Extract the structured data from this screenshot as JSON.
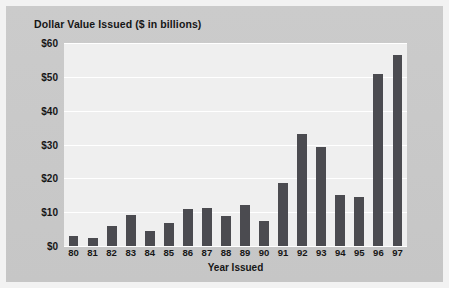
{
  "chart_data": {
    "type": "bar",
    "title": "Dollar Value Issued ($ in billions)",
    "xlabel": "Year Issued",
    "ylabel": "",
    "categories": [
      "80",
      "81",
      "82",
      "83",
      "84",
      "85",
      "86",
      "87",
      "88",
      "89",
      "90",
      "91",
      "92",
      "93",
      "94",
      "95",
      "96",
      "97"
    ],
    "values": [
      3.0,
      2.3,
      5.8,
      9.2,
      4.5,
      6.7,
      10.8,
      11.1,
      8.9,
      12.0,
      7.5,
      18.5,
      33.0,
      29.2,
      15.0,
      14.6,
      50.8,
      56.6
    ],
    "ylim": [
      0,
      60
    ],
    "ytick_values": [
      0,
      10,
      20,
      30,
      40,
      50,
      60
    ],
    "ytick_labels": [
      "$0",
      "$10",
      "$20",
      "$30",
      "$40",
      "$50",
      "$60"
    ],
    "grid": true,
    "legend": "none",
    "bar_color": "#4b4b50",
    "plot_background": "#efefef",
    "gridline_color": "#ffffff",
    "figure_background": "#c9c9c9"
  }
}
